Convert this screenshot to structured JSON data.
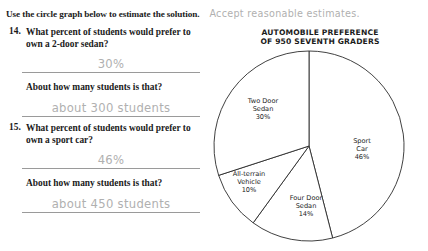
{
  "instruction": {
    "text": "Use the circle graph below to estimate the solution.",
    "note": "Accept reasonable estimates."
  },
  "questions": [
    {
      "number": "14.",
      "prompt_line1": "What percent of students would prefer",
      "prompt_line2": "to own a 2-door sedan?",
      "answer1": "30%",
      "prompt2": "About how many students is that?",
      "answer2": "about 300 students"
    },
    {
      "number": "15.",
      "prompt_line1": "What percent of students would prefer",
      "prompt_line2": "to own a sport car?",
      "answer1": "46%",
      "prompt2": "About how many students is that?",
      "answer2": "about 450 students"
    }
  ],
  "chart_data": {
    "type": "pie",
    "title": "AUTOMOBILE PREFERENCE OF 950 SEVENTH GRADERS",
    "title_line1": "AUTOMOBILE PREFERENCE",
    "title_line2": "OF 950 SEVENTH GRADERS",
    "total_label": "950 seventh graders",
    "total": 950,
    "start_angle_deg": 0,
    "direction": "clockwise",
    "legend": "none",
    "grid": false,
    "categories": [
      "Sport Car",
      "Four Door Sedan",
      "All-terrain Vehicle",
      "Two Door Sedan"
    ],
    "values": [
      46,
      14,
      10,
      30
    ],
    "slices": [
      {
        "name": "Sport Car",
        "percent": 46,
        "label_line1": "Sport",
        "label_line2": "Car",
        "label_line3": "46%"
      },
      {
        "name": "Four Door Sedan",
        "percent": 14,
        "label_line1": "Four Door",
        "label_line2": "Sedan",
        "label_line3": "14%"
      },
      {
        "name": "All-terrain Vehicle",
        "percent": 10,
        "label_line1": "All-terrain",
        "label_line2": "Vehicle",
        "label_line3": "10%"
      },
      {
        "name": "Two Door Sedan",
        "percent": 30,
        "label_line1": "Two Door",
        "label_line2": "Sedan",
        "label_line3": "30%"
      }
    ],
    "colors": {
      "slice_fill": "#ffffff",
      "slice_stroke": "#2b2b2b",
      "ink": "#b0b0b0"
    }
  }
}
